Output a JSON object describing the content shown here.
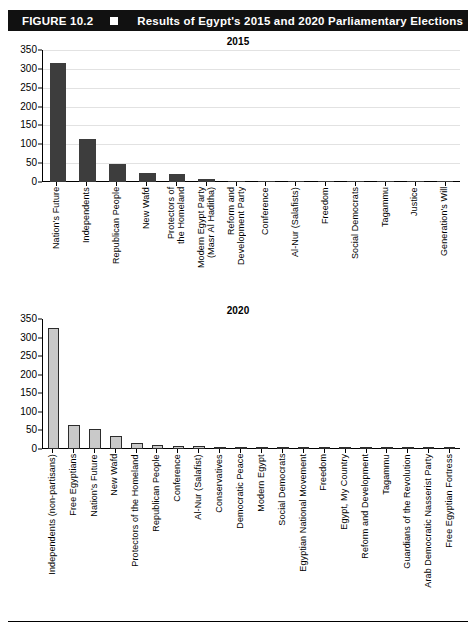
{
  "header": {
    "figure_label": "FIGURE 10.2",
    "bullet_icon": "square-bullet-icon",
    "title": "Results of Egypt's 2015 and 2020 Parliamentary Elections"
  },
  "chart_data": [
    {
      "type": "bar",
      "title": "2015",
      "xlabel": "",
      "ylabel": "",
      "ylim": [
        0,
        350
      ],
      "yticks": [
        0,
        50,
        100,
        150,
        200,
        250,
        300,
        350
      ],
      "grid": true,
      "legend": "none",
      "bar_color": "#3d3d3d",
      "categories": [
        "Nation's Future",
        "Independents",
        "Republican People",
        "New Wafd",
        "Protectors of the Homeland",
        "Modern Egypt Party (Masr Al Haditha)",
        "Reform and Development Party",
        "Conference",
        "Al-Nur (Salafists)",
        "Freedom",
        "Social Democrats",
        "Tagammu",
        "Justice",
        "Generation's Will"
      ],
      "values": [
        316,
        115,
        47,
        23,
        21,
        9,
        4,
        3,
        3,
        3,
        3,
        3,
        2,
        2
      ]
    },
    {
      "type": "bar",
      "title": "2020",
      "xlabel": "",
      "ylabel": "",
      "ylim": [
        0,
        350
      ],
      "yticks": [
        0,
        50,
        100,
        150,
        200,
        250,
        300,
        350
      ],
      "grid": false,
      "legend": "none",
      "bar_color": "#c9c9c9",
      "bar_edge_color": "#2c2c2c",
      "categories": [
        "Independents (non-partisans)",
        "Free Egyptians",
        "Nation's Future",
        "New Wafd",
        "Protectors of the Homeland",
        "Republican People",
        "Conference",
        "Al-Nur (Salafist)",
        "Conservatives",
        "Democratic Peace",
        "Modern Egypt",
        "Social Democrats",
        "Egyptian National Movement",
        "Freedom",
        "Egypt, My Country",
        "Reform and Development",
        "Tagammu",
        "Guardians of the Revolution",
        "Arab Democratic Nasserist Party",
        "Free Egyptian Fortress"
      ],
      "values": [
        325,
        65,
        53,
        34,
        17,
        10,
        9,
        7,
        3,
        3,
        2,
        2,
        2,
        1,
        1,
        1,
        1,
        1,
        1,
        1
      ]
    }
  ]
}
